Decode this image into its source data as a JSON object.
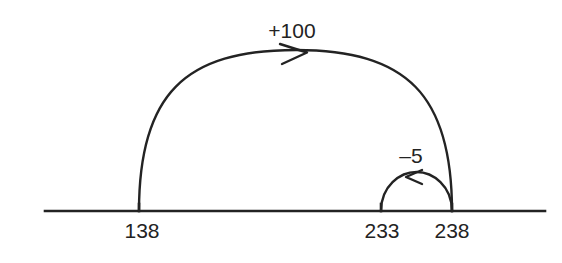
{
  "diagram": {
    "type": "number-line-jump-strategy",
    "background_color": "#ffffff",
    "ink_color": "#232323",
    "title": "",
    "number_line": {
      "name": "number-line",
      "start_x": 45,
      "end_x": 545,
      "y": 211
    },
    "tick_marks": [
      {
        "label": "138",
        "x": 139,
        "label_x": 142,
        "label_y": 238
      },
      {
        "label": "233",
        "x": 381,
        "label_x": 382,
        "label_y": 238
      },
      {
        "label": "238",
        "x": 452,
        "label_x": 452,
        "label_y": 238
      }
    ],
    "jumps": [
      {
        "name": "jump-plus-100",
        "label": "+100",
        "value": 100,
        "direction": "right",
        "from": "138",
        "to": "238",
        "from_x": 139,
        "to_x": 452,
        "apex_y": 50,
        "label_x": 292,
        "label_y": 38,
        "arrow_tip_x": 307,
        "arrow_tip_y": 52
      },
      {
        "name": "jump-minus-5",
        "label": "–5",
        "value": -5,
        "direction": "left",
        "from": "238",
        "to": "233",
        "from_x": 452,
        "to_x": 381,
        "apex_y": 172,
        "label_x": 411,
        "label_y": 163,
        "arrow_tip_x": 406,
        "arrow_tip_y": 177
      }
    ]
  }
}
